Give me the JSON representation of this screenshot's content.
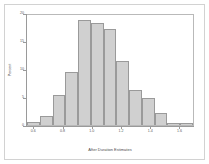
{
  "chart_data": {
    "type": "bar",
    "title": "",
    "xlabel": "After Duration Estimates",
    "ylabel": "Percent",
    "xlim": [
      0.55,
      1.7
    ],
    "ylim": [
      0,
      20
    ],
    "grid": false,
    "legend": null,
    "bin_width": 0.05,
    "categories": [
      "0.575",
      "0.625",
      "0.675",
      "0.725",
      "0.775",
      "0.825",
      "0.875",
      "0.925",
      "0.975",
      "1.025",
      "1.075",
      "1.125",
      "1.175",
      "1.225",
      "1.275",
      "1.325",
      "1.375",
      "1.425",
      "1.475",
      "1.525",
      "1.575",
      "1.625",
      "1.675"
    ],
    "values": [
      0.6,
      0,
      1.6,
      0,
      5.4,
      0,
      9.4,
      0,
      18.7,
      18.2,
      0,
      17.2,
      0,
      11.4,
      0,
      6.2,
      0,
      4.8,
      0,
      2.2,
      0.4,
      0.3,
      0.2
    ],
    "bars": [
      {
        "x_center": "0.575",
        "height": 0.6
      },
      {
        "x_center": "0.675",
        "height": 1.6
      },
      {
        "x_center": "0.775",
        "height": 5.4
      },
      {
        "x_center": "0.875",
        "height": 9.4
      },
      {
        "x_center": "0.975",
        "height": 18.7
      },
      {
        "x_center": "1.025",
        "height": 18.2
      },
      {
        "x_center": "1.125",
        "height": 17.2
      },
      {
        "x_center": "1.225",
        "height": 11.4
      },
      {
        "x_center": "1.325",
        "height": 6.2
      },
      {
        "x_center": "1.425",
        "height": 4.8
      },
      {
        "x_center": "1.525",
        "height": 2.2
      },
      {
        "x_center": "1.600",
        "height": 0.4
      },
      {
        "x_center": "1.670",
        "height": 0.3
      }
    ],
    "xticks": [
      {
        "value": 0.6,
        "label": "0.6"
      },
      {
        "value": 0.8,
        "label": "0.8"
      },
      {
        "value": 1.0,
        "label": "1.0"
      },
      {
        "value": 1.2,
        "label": "1.2"
      },
      {
        "value": 1.4,
        "label": "1.4"
      },
      {
        "value": 1.6,
        "label": "1.6"
      }
    ],
    "yticks": [
      {
        "value": 0,
        "label": "0"
      },
      {
        "value": 5,
        "label": "5"
      },
      {
        "value": 10,
        "label": "10"
      },
      {
        "value": 15,
        "label": "15"
      },
      {
        "value": 20,
        "label": "20"
      }
    ],
    "colors": {
      "bar_fill": "#d0d0d0",
      "bar_edge": "#9a9a9a",
      "axis": "#9a9a9a",
      "frame": "#d2d2d2",
      "text": "#4a4a4a",
      "background": "#ffffff"
    }
  }
}
